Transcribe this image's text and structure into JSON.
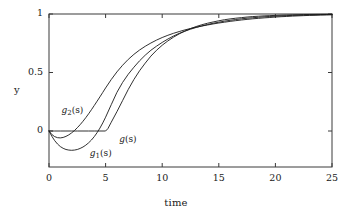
{
  "chart_data": {
    "type": "line",
    "title": "",
    "xlabel": "time",
    "ylabel": "y",
    "xlim": [
      0,
      25
    ],
    "ylim": [
      -0.22,
      1.04
    ],
    "xticks": [
      0,
      5,
      10,
      15,
      20,
      25
    ],
    "xticklabels": [
      "0",
      "5",
      "10",
      "15",
      "20",
      "25"
    ],
    "yticks": [
      0,
      0.5,
      1
    ],
    "yticklabels": [
      "0",
      "0.5",
      "1"
    ],
    "grid": false,
    "legend": "inline-annotations",
    "annotations": [
      {
        "name": "g2",
        "text": "g2(s)",
        "base": "g",
        "sub": "2",
        "x": 1.1,
        "y": 0.17
      },
      {
        "name": "g1",
        "text": "g1(s)",
        "base": "g",
        "sub": "1",
        "x": 3.6,
        "y": -0.2
      },
      {
        "name": "g",
        "text": "g(s)",
        "base": "g",
        "sub": "",
        "x": 6.2,
        "y": -0.075
      }
    ],
    "series": [
      {
        "name": "g(s)",
        "x": [
          0,
          0.5,
          1,
          1.5,
          2,
          2.5,
          3,
          3.5,
          4,
          4.5,
          5,
          5.2,
          5.5,
          6,
          6.5,
          7,
          7.5,
          8,
          8.5,
          9,
          9.5,
          10,
          10.5,
          11,
          11.5,
          12,
          12.5,
          13,
          13.5,
          14,
          14.5,
          15,
          15.5,
          16,
          16.5,
          17,
          17.5,
          18,
          18.5,
          19,
          19.5,
          20,
          20.5,
          21,
          21.5,
          22,
          22.5,
          23,
          23.5,
          24,
          24.5,
          25
        ],
        "y": [
          0,
          0,
          0,
          0,
          0,
          0,
          0,
          0,
          0,
          0,
          0,
          0.02,
          0.075,
          0.165,
          0.26,
          0.355,
          0.44,
          0.515,
          0.58,
          0.64,
          0.69,
          0.733,
          0.77,
          0.802,
          0.83,
          0.854,
          0.875,
          0.893,
          0.908,
          0.921,
          0.932,
          0.942,
          0.951,
          0.958,
          0.964,
          0.969,
          0.974,
          0.978,
          0.981,
          0.984,
          0.986,
          0.988,
          0.99,
          0.9915,
          0.993,
          0.994,
          0.995,
          0.996,
          0.9965,
          0.997,
          0.9975,
          0.998
        ]
      },
      {
        "name": "g1(s)",
        "x": [
          0,
          0.25,
          0.5,
          0.75,
          1,
          1.25,
          1.5,
          1.75,
          2,
          2.25,
          2.5,
          2.75,
          3,
          3.25,
          3.5,
          3.75,
          4,
          4.25,
          4.5,
          4.75,
          5,
          5.5,
          6,
          6.5,
          7,
          7.5,
          8,
          8.5,
          9,
          9.5,
          10,
          10.5,
          11,
          11.5,
          12,
          12.5,
          13,
          13.5,
          14,
          14.5,
          15,
          15.5,
          16,
          16.5,
          17,
          17.5,
          18,
          18.5,
          19,
          19.5,
          20,
          20.5,
          21,
          21.5,
          22,
          22.5,
          23,
          23.5,
          24,
          24.5,
          25
        ],
        "y": [
          0,
          -0.045,
          -0.082,
          -0.111,
          -0.133,
          -0.148,
          -0.158,
          -0.163,
          -0.165,
          -0.163,
          -0.158,
          -0.149,
          -0.137,
          -0.121,
          -0.101,
          -0.077,
          -0.048,
          -0.014,
          0.025,
          0.069,
          0.118,
          0.225,
          0.33,
          0.415,
          0.485,
          0.545,
          0.6,
          0.648,
          0.69,
          0.725,
          0.757,
          0.786,
          0.812,
          0.834,
          0.853,
          0.87,
          0.885,
          0.898,
          0.91,
          0.921,
          0.93,
          0.939,
          0.946,
          0.953,
          0.959,
          0.964,
          0.968,
          0.972,
          0.976,
          0.979,
          0.981,
          0.984,
          0.986,
          0.988,
          0.989,
          0.991,
          0.992,
          0.993,
          0.994,
          0.995,
          0.996
        ]
      },
      {
        "name": "g2(s)",
        "x": [
          0,
          0.25,
          0.5,
          0.75,
          1,
          1.25,
          1.5,
          1.75,
          2,
          2.25,
          2.5,
          2.75,
          3,
          3.25,
          3.5,
          3.75,
          4,
          4.25,
          4.5,
          4.75,
          5,
          5.5,
          6,
          6.5,
          7,
          7.5,
          8,
          8.5,
          9,
          9.5,
          10,
          10.5,
          11,
          11.5,
          12,
          12.5,
          13,
          13.5,
          14,
          14.5,
          15,
          15.5,
          16,
          16.5,
          17,
          17.5,
          18,
          18.5,
          19,
          19.5,
          20,
          20.5,
          21,
          21.5,
          22,
          22.5,
          23,
          23.5,
          24,
          24.5,
          25
        ],
        "y": [
          0,
          -0.03,
          -0.048,
          -0.057,
          -0.059,
          -0.055,
          -0.046,
          -0.033,
          -0.016,
          0.004,
          0.028,
          0.054,
          0.083,
          0.114,
          0.147,
          0.182,
          0.218,
          0.255,
          0.292,
          0.33,
          0.368,
          0.44,
          0.505,
          0.562,
          0.612,
          0.655,
          0.692,
          0.724,
          0.752,
          0.777,
          0.799,
          0.818,
          0.835,
          0.85,
          0.864,
          0.876,
          0.887,
          0.897,
          0.906,
          0.915,
          0.923,
          0.93,
          0.937,
          0.943,
          0.949,
          0.954,
          0.959,
          0.963,
          0.967,
          0.97,
          0.974,
          0.977,
          0.979,
          0.982,
          0.984,
          0.986,
          0.988,
          0.989,
          0.991,
          0.992,
          0.993
        ]
      }
    ],
    "style": {
      "line_color": "#1a1a1a",
      "line_width": 0.9,
      "frame_color": "#3a3a3a",
      "background": "#ffffff"
    },
    "frame_px": {
      "left": 49,
      "right": 332,
      "top": 14,
      "bottom": 167,
      "y_at_zero": 131,
      "y_at_half": 72,
      "y_at_one": 14
    }
  }
}
